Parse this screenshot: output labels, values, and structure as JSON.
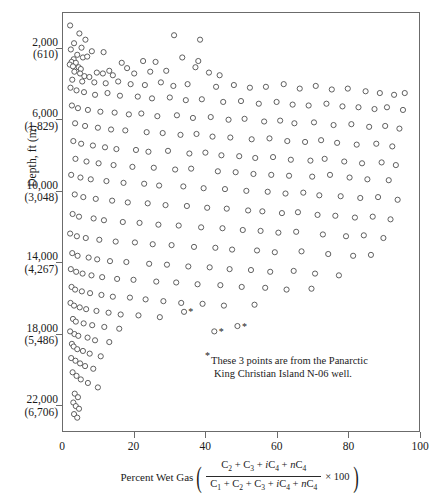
{
  "figure": {
    "type": "scatter",
    "background": "#ffffff",
    "marker_color": "#4d4d4d",
    "frame_color": "#6b6b6b"
  },
  "y_axis": {
    "title": "Depth, ft (m)",
    "ticks": [
      {
        "ft": "2,000",
        "m": "(610)",
        "value": 2000
      },
      {
        "ft": "6,000",
        "m": "(1,829)",
        "value": 6000
      },
      {
        "ft": "10,000",
        "m": "(3,048)",
        "value": 10000
      },
      {
        "ft": "14,000",
        "m": "(4,267)",
        "value": 14000
      },
      {
        "ft": "18,000",
        "m": "(5,486)",
        "value": 18000
      },
      {
        "ft": "22,000",
        "m": "(6,706)",
        "value": 22000
      }
    ],
    "range": [
      0,
      23500
    ],
    "inverted": true
  },
  "x_axis": {
    "caption_prefix": "Percent Wet Gas",
    "numerator": "C2 + C3 + iC4 + nC4",
    "denominator": "C1 + C2 + C3 + iC4 + nC4",
    "multiplier": "× 100",
    "ticks": [
      "0",
      "20",
      "40",
      "60",
      "80",
      "100"
    ],
    "tick_values": [
      0,
      20,
      40,
      60,
      80,
      100
    ],
    "range": [
      0,
      100
    ]
  },
  "footnote": {
    "star": "*",
    "line1": "These 3 points are from the Panarctic",
    "line2": "King Christian Island N-06 well."
  },
  "starred_points": [
    {
      "x": 34.0,
      "y": 16800
    },
    {
      "x": 42.5,
      "y": 17900
    },
    {
      "x": 49.0,
      "y": 17600
    }
  ],
  "chart_data": {
    "type": "scatter",
    "title": "",
    "xlabel": "Percent Wet Gas ((C2+C3+iC4+nC4)/(C1+C2+C3+iC4+nC4) x 100)",
    "ylabel": "Depth, ft (m)",
    "xlim": [
      0,
      100
    ],
    "ylim": [
      23500,
      0
    ],
    "grid": false,
    "legend": "none",
    "marker": "open-circle",
    "points": [
      [
        2.0,
        700
      ],
      [
        4.6,
        1150
      ],
      [
        3.1,
        1700
      ],
      [
        6.3,
        1500
      ],
      [
        5.2,
        1950
      ],
      [
        2.2,
        2050
      ],
      [
        8.1,
        2150
      ],
      [
        31.2,
        1250
      ],
      [
        38.5,
        1500
      ],
      [
        11.4,
        2200
      ],
      [
        4.0,
        2350
      ],
      [
        5.6,
        2500
      ],
      [
        6.8,
        2450
      ],
      [
        3.0,
        2600
      ],
      [
        2.4,
        2750
      ],
      [
        3.6,
        2800
      ],
      [
        1.9,
        2900
      ],
      [
        2.8,
        3000
      ],
      [
        4.4,
        3050
      ],
      [
        5.0,
        3150
      ],
      [
        22.5,
        2700
      ],
      [
        26.0,
        2750
      ],
      [
        33.5,
        2500
      ],
      [
        38.0,
        2700
      ],
      [
        37.2,
        3050
      ],
      [
        16.5,
        2800
      ],
      [
        18.0,
        3100
      ],
      [
        13.0,
        3250
      ],
      [
        9.5,
        3350
      ],
      [
        11.2,
        3400
      ],
      [
        14.0,
        3500
      ],
      [
        20.0,
        3400
      ],
      [
        24.5,
        3300
      ],
      [
        29.0,
        3250
      ],
      [
        41.0,
        3350
      ],
      [
        44.0,
        3500
      ],
      [
        3.2,
        3300
      ],
      [
        4.8,
        3400
      ],
      [
        6.0,
        3550
      ],
      [
        7.4,
        3600
      ],
      [
        2.6,
        3750
      ],
      [
        5.4,
        3850
      ],
      [
        8.8,
        3900
      ],
      [
        12.0,
        3950
      ],
      [
        15.5,
        3850
      ],
      [
        19.0,
        4000
      ],
      [
        23.0,
        4050
      ],
      [
        27.5,
        3900
      ],
      [
        31.0,
        4100
      ],
      [
        35.0,
        4000
      ],
      [
        43.0,
        4150
      ],
      [
        48.0,
        4050
      ],
      [
        52.5,
        4200
      ],
      [
        57.0,
        4150
      ],
      [
        62.0,
        4000
      ],
      [
        66.5,
        4250
      ],
      [
        71.0,
        4100
      ],
      [
        75.5,
        4300
      ],
      [
        80.0,
        4250
      ],
      [
        85.0,
        4400
      ],
      [
        89.0,
        4500
      ],
      [
        93.0,
        4600
      ],
      [
        96.0,
        4500
      ],
      [
        2.1,
        4200
      ],
      [
        3.8,
        4350
      ],
      [
        5.9,
        4450
      ],
      [
        9.0,
        4600
      ],
      [
        12.5,
        4500
      ],
      [
        16.0,
        4650
      ],
      [
        21.0,
        4700
      ],
      [
        25.0,
        4800
      ],
      [
        30.0,
        4750
      ],
      [
        34.5,
        4900
      ],
      [
        39.0,
        4850
      ],
      [
        45.0,
        5000
      ],
      [
        50.0,
        4950
      ],
      [
        55.0,
        5100
      ],
      [
        60.0,
        5000
      ],
      [
        64.5,
        5150
      ],
      [
        69.0,
        5200
      ],
      [
        74.0,
        5100
      ],
      [
        78.5,
        5250
      ],
      [
        83.0,
        5300
      ],
      [
        87.5,
        5400
      ],
      [
        91.0,
        5300
      ],
      [
        95.5,
        5450
      ],
      [
        2.5,
        5200
      ],
      [
        4.2,
        5350
      ],
      [
        7.0,
        5450
      ],
      [
        10.5,
        5550
      ],
      [
        14.5,
        5600
      ],
      [
        18.5,
        5700
      ],
      [
        22.0,
        5650
      ],
      [
        26.5,
        5800
      ],
      [
        32.0,
        5750
      ],
      [
        36.5,
        5900
      ],
      [
        41.5,
        5850
      ],
      [
        46.5,
        6000
      ],
      [
        51.0,
        5950
      ],
      [
        56.5,
        6100
      ],
      [
        61.0,
        6050
      ],
      [
        65.0,
        6200
      ],
      [
        70.5,
        6150
      ],
      [
        76.0,
        6300
      ],
      [
        81.0,
        6250
      ],
      [
        86.0,
        6400
      ],
      [
        90.5,
        6350
      ],
      [
        94.5,
        6500
      ],
      [
        3.4,
        6200
      ],
      [
        6.2,
        6350
      ],
      [
        9.8,
        6450
      ],
      [
        13.5,
        6550
      ],
      [
        17.5,
        6600
      ],
      [
        23.5,
        6700
      ],
      [
        28.0,
        6750
      ],
      [
        33.0,
        6850
      ],
      [
        37.5,
        6800
      ],
      [
        42.0,
        6950
      ],
      [
        47.0,
        7000
      ],
      [
        53.0,
        7100
      ],
      [
        58.0,
        7050
      ],
      [
        63.0,
        7200
      ],
      [
        68.0,
        7250
      ],
      [
        72.5,
        7150
      ],
      [
        77.0,
        7300
      ],
      [
        82.5,
        7400
      ],
      [
        88.0,
        7350
      ],
      [
        92.5,
        7500
      ],
      [
        2.9,
        7200
      ],
      [
        5.1,
        7350
      ],
      [
        8.4,
        7450
      ],
      [
        11.8,
        7550
      ],
      [
        15.0,
        7650
      ],
      [
        20.5,
        7700
      ],
      [
        24.0,
        7800
      ],
      [
        29.5,
        7750
      ],
      [
        35.5,
        7900
      ],
      [
        40.0,
        7850
      ],
      [
        44.5,
        8000
      ],
      [
        49.5,
        8050
      ],
      [
        54.0,
        8150
      ],
      [
        59.0,
        8100
      ],
      [
        64.0,
        8250
      ],
      [
        69.5,
        8300
      ],
      [
        73.5,
        8200
      ],
      [
        79.0,
        8350
      ],
      [
        84.0,
        8450
      ],
      [
        89.5,
        8400
      ],
      [
        93.5,
        8550
      ],
      [
        3.5,
        8200
      ],
      [
        6.6,
        8350
      ],
      [
        10.0,
        8450
      ],
      [
        14.2,
        8550
      ],
      [
        19.5,
        8650
      ],
      [
        25.5,
        8700
      ],
      [
        31.5,
        8800
      ],
      [
        36.0,
        8750
      ],
      [
        43.5,
        8900
      ],
      [
        48.5,
        8950
      ],
      [
        53.5,
        9050
      ],
      [
        58.5,
        9100
      ],
      [
        63.5,
        9150
      ],
      [
        70.0,
        9200
      ],
      [
        75.0,
        9100
      ],
      [
        80.5,
        9250
      ],
      [
        85.5,
        9350
      ],
      [
        91.5,
        9400
      ],
      [
        2.3,
        9100
      ],
      [
        4.9,
        9250
      ],
      [
        7.8,
        9350
      ],
      [
        12.2,
        9450
      ],
      [
        17.0,
        9550
      ],
      [
        22.8,
        9600
      ],
      [
        27.0,
        9700
      ],
      [
        33.8,
        9750
      ],
      [
        39.5,
        9850
      ],
      [
        45.5,
        9900
      ],
      [
        51.5,
        10000
      ],
      [
        57.5,
        10050
      ],
      [
        62.5,
        10150
      ],
      [
        67.5,
        10100
      ],
      [
        72.0,
        10250
      ],
      [
        78.0,
        10300
      ],
      [
        83.5,
        10400
      ],
      [
        88.5,
        10350
      ],
      [
        94.0,
        10500
      ],
      [
        3.3,
        10200
      ],
      [
        5.7,
        10350
      ],
      [
        9.2,
        10450
      ],
      [
        13.8,
        10550
      ],
      [
        18.2,
        10650
      ],
      [
        23.8,
        10700
      ],
      [
        28.8,
        10800
      ],
      [
        34.8,
        10850
      ],
      [
        40.5,
        10950
      ],
      [
        46.0,
        11000
      ],
      [
        52.0,
        11100
      ],
      [
        56.0,
        11150
      ],
      [
        61.5,
        11250
      ],
      [
        66.0,
        11200
      ],
      [
        71.5,
        11350
      ],
      [
        76.5,
        11400
      ],
      [
        82.0,
        11500
      ],
      [
        87.0,
        11450
      ],
      [
        92.0,
        11600
      ],
      [
        2.7,
        11300
      ],
      [
        4.5,
        11450
      ],
      [
        8.6,
        11550
      ],
      [
        11.5,
        11650
      ],
      [
        16.8,
        11750
      ],
      [
        21.5,
        11800
      ],
      [
        26.8,
        11900
      ],
      [
        32.5,
        11950
      ],
      [
        38.8,
        12050
      ],
      [
        44.8,
        12100
      ],
      [
        50.5,
        12200
      ],
      [
        55.5,
        12250
      ],
      [
        60.5,
        12350
      ],
      [
        65.5,
        12300
      ],
      [
        73.0,
        12450
      ],
      [
        79.5,
        12550
      ],
      [
        84.5,
        12500
      ],
      [
        90.0,
        12650
      ],
      [
        2.0,
        12400
      ],
      [
        3.9,
        12550
      ],
      [
        6.4,
        12650
      ],
      [
        10.2,
        12750
      ],
      [
        14.8,
        12850
      ],
      [
        20.2,
        12900
      ],
      [
        25.2,
        13000
      ],
      [
        30.5,
        13050
      ],
      [
        36.8,
        13150
      ],
      [
        42.8,
        13200
      ],
      [
        47.5,
        13300
      ],
      [
        54.5,
        13350
      ],
      [
        59.5,
        13450
      ],
      [
        67.0,
        13400
      ],
      [
        74.5,
        13550
      ],
      [
        81.5,
        13650
      ],
      [
        86.5,
        13600
      ],
      [
        2.6,
        13500
      ],
      [
        4.1,
        13650
      ],
      [
        7.2,
        13750
      ],
      [
        9.6,
        13850
      ],
      [
        13.2,
        13950
      ],
      [
        17.8,
        14000
      ],
      [
        24.2,
        14100
      ],
      [
        29.2,
        14150
      ],
      [
        35.2,
        14250
      ],
      [
        41.2,
        14300
      ],
      [
        46.8,
        14400
      ],
      [
        52.8,
        14450
      ],
      [
        58.2,
        14550
      ],
      [
        64.8,
        14500
      ],
      [
        70.8,
        14650
      ],
      [
        77.5,
        14750
      ],
      [
        2.2,
        14400
      ],
      [
        3.7,
        14550
      ],
      [
        5.5,
        14650
      ],
      [
        8.0,
        14750
      ],
      [
        11.0,
        14850
      ],
      [
        15.2,
        14950
      ],
      [
        19.8,
        15000
      ],
      [
        26.2,
        15100
      ],
      [
        31.8,
        15150
      ],
      [
        37.8,
        15250
      ],
      [
        44.2,
        15300
      ],
      [
        50.2,
        15400
      ],
      [
        56.8,
        15450
      ],
      [
        62.8,
        15550
      ],
      [
        69.8,
        15500
      ],
      [
        2.4,
        15400
      ],
      [
        3.4,
        15550
      ],
      [
        5.3,
        15650
      ],
      [
        7.6,
        15750
      ],
      [
        10.8,
        15850
      ],
      [
        14.0,
        15950
      ],
      [
        18.8,
        16000
      ],
      [
        23.2,
        16100
      ],
      [
        28.2,
        16200
      ],
      [
        33.2,
        16300
      ],
      [
        39.2,
        16350
      ],
      [
        45.2,
        16450
      ],
      [
        53.8,
        16400
      ],
      [
        2.1,
        16300
      ],
      [
        3.1,
        16450
      ],
      [
        4.7,
        16550
      ],
      [
        6.5,
        16650
      ],
      [
        9.4,
        16750
      ],
      [
        12.8,
        16850
      ],
      [
        16.2,
        16950
      ],
      [
        21.2,
        17000
      ],
      [
        27.2,
        17100
      ],
      [
        2.8,
        17200
      ],
      [
        3.6,
        17350
      ],
      [
        5.8,
        17450
      ],
      [
        8.2,
        17550
      ],
      [
        11.6,
        17650
      ],
      [
        15.8,
        17750
      ],
      [
        2.0,
        17900
      ],
      [
        3.2,
        18050
      ],
      [
        4.3,
        18150
      ],
      [
        6.9,
        18250
      ],
      [
        9.0,
        18400
      ],
      [
        13.0,
        18500
      ],
      [
        2.5,
        18600
      ],
      [
        3.0,
        18750
      ],
      [
        4.0,
        18900
      ],
      [
        5.6,
        19000
      ],
      [
        7.5,
        19150
      ],
      [
        10.6,
        19300
      ],
      [
        2.3,
        19400
      ],
      [
        3.5,
        19550
      ],
      [
        4.8,
        19700
      ],
      [
        6.2,
        19850
      ],
      [
        8.5,
        20000
      ],
      [
        2.7,
        20200
      ],
      [
        3.8,
        20400
      ],
      [
        5.0,
        20600
      ],
      [
        7.0,
        20800
      ],
      [
        9.8,
        21050
      ],
      [
        3.3,
        21400
      ],
      [
        4.2,
        21600
      ],
      [
        2.9,
        21900
      ],
      [
        3.6,
        22100
      ],
      [
        4.5,
        22250
      ],
      [
        3.1,
        22550
      ],
      [
        4.0,
        22750
      ]
    ]
  }
}
